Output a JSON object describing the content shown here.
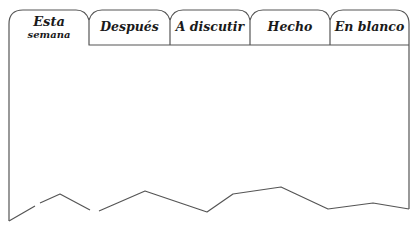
{
  "tabs": [
    {
      "label": "Esta",
      "sublabel": "semana",
      "active": true
    },
    {
      "label": "Después",
      "sublabel": "",
      "active": false
    },
    {
      "label": "A discutir",
      "sublabel": "",
      "active": false
    },
    {
      "label": "Hecho",
      "sublabel": "",
      "active": false
    },
    {
      "label": "En blanco",
      "sublabel": "",
      "active": false
    }
  ],
  "colors": {
    "stroke": "#555555",
    "background": "#ffffff",
    "text": "#1a1a1a"
  }
}
